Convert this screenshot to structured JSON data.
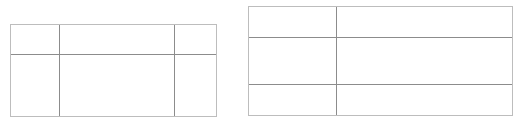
{
  "tables": [
    {
      "name": "left-table",
      "rows": 2,
      "columns": 3,
      "cells": [
        [
          "",
          "",
          ""
        ],
        [
          "",
          "",
          ""
        ]
      ]
    },
    {
      "name": "right-table",
      "rows": 3,
      "columns": 2,
      "cells": [
        [
          "",
          ""
        ],
        [
          "",
          ""
        ],
        [
          "",
          ""
        ]
      ]
    }
  ],
  "colors": {
    "outer_border": "#bdbdbd",
    "inner_line": "#8c8c8c",
    "background": "#ffffff"
  }
}
